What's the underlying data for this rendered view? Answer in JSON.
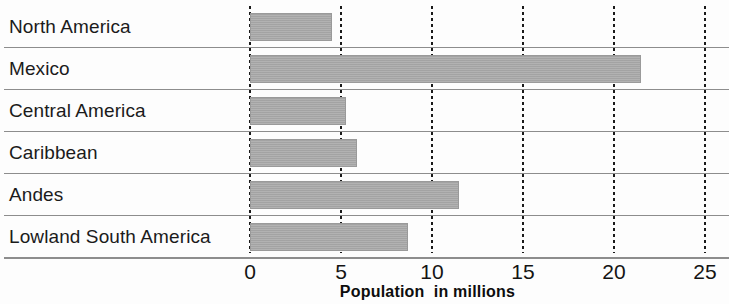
{
  "chart_data": {
    "type": "bar",
    "orientation": "horizontal",
    "title": "",
    "subtitle": "",
    "xlabel": "Population  in millions",
    "ylabel": "",
    "xlim": [
      0,
      25
    ],
    "xticks": [
      0,
      5,
      10,
      15,
      20,
      25
    ],
    "xticklabels": [
      "0",
      "5",
      "10",
      "15",
      "20",
      "25"
    ],
    "grid": true,
    "grid_style": "dotted-vertical",
    "legend": null,
    "categories": [
      "North America",
      "Mexico",
      "Central America",
      "Caribbean",
      "Andes",
      "Lowland South America"
    ],
    "values": [
      4.5,
      21.5,
      5.3,
      5.9,
      11.5,
      8.7
    ],
    "series": [
      {
        "name": "Population in millions",
        "values": [
          4.5,
          21.5,
          5.3,
          5.9,
          11.5,
          8.7
        ]
      }
    ],
    "bars": [
      {
        "label": "North America",
        "value": 4.5
      },
      {
        "label": "Mexico",
        "value": 21.5
      },
      {
        "label": "Central America",
        "value": 5.3
      },
      {
        "label": "Caribbean",
        "value": 5.9
      },
      {
        "label": "Andes",
        "value": 11.5
      },
      {
        "label": "Lowland South America",
        "value": 8.7
      }
    ],
    "colors": {
      "bar_fill": "#a9a9a9",
      "bar_stroke": "#9a9a9a",
      "gridline": "#1a1a1a",
      "row_separator": "#8d8d8d",
      "text": "#141414",
      "background": "#fdfdfd"
    }
  }
}
